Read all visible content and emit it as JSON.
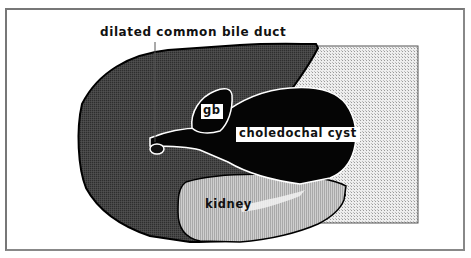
{
  "figure": {
    "title_label": "dilated common bile duct",
    "structures": [
      {
        "id": "liver",
        "label": "",
        "fill": "#3d3d3d"
      },
      {
        "id": "gallbladder",
        "label": "gb",
        "fill": "#050505"
      },
      {
        "id": "choledochal-cyst",
        "label": "choledochal cyst",
        "fill": "#050505"
      },
      {
        "id": "kidney",
        "label": "kidney",
        "fill": "#c4c4c4"
      },
      {
        "id": "background-region",
        "label": "",
        "fill": "#e6e6e6"
      }
    ]
  },
  "labels": {
    "top": "dilated common bile duct",
    "gb": "gb",
    "cyst": "choledochal cyst",
    "kidney": "kidney"
  },
  "colors": {
    "liver": "#3d3d3d",
    "cyst": "#050505",
    "kidney": "#c4c4c4",
    "stipple": "#e4e4e4",
    "outline": "#ffffff"
  }
}
